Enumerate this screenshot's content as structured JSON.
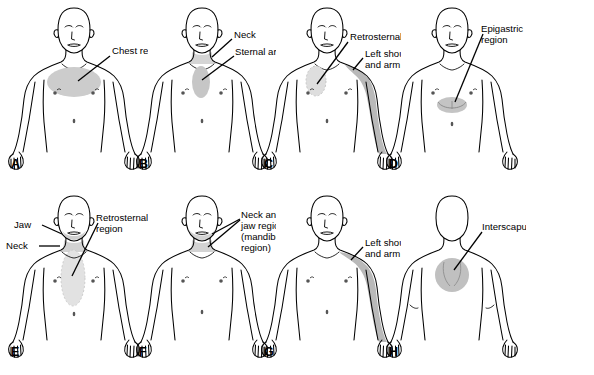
{
  "figure": {
    "body_outline_color": "#000000",
    "shade_color_light": "#d8d8d8",
    "shade_color_mid": "#c6c6c6",
    "shade_color_dark": "#b4b4b4",
    "background": "#ffffff",
    "caption_fragment": ""
  },
  "panels": [
    {
      "letter": "A",
      "view": "anterior",
      "labels": [
        {
          "text": "Chest region",
          "region": "chest"
        }
      ],
      "regions": [
        {
          "name": "chest-region",
          "shape": "ellipse",
          "shade": "#cccccc"
        }
      ]
    },
    {
      "letter": "B",
      "view": "anterior",
      "labels": [
        {
          "text": "Neck",
          "region": "neck"
        },
        {
          "text": "Sternal area",
          "region": "sternum"
        }
      ],
      "regions": [
        {
          "name": "neck-region",
          "shape": "band",
          "shade": "#d5d5d5"
        },
        {
          "name": "sternal-area",
          "shape": "vertical-oval",
          "shade": "#c6c6c6"
        }
      ]
    },
    {
      "letter": "C",
      "view": "anterior",
      "labels": [
        {
          "text": "Retrosternal region",
          "region": "retrosternal"
        },
        {
          "text": "Left shoulder",
          "region": "shoulder-arm"
        },
        {
          "text": "and arm",
          "region": "shoulder-arm"
        }
      ],
      "regions": [
        {
          "name": "retrosternal-region",
          "shape": "vertical-oval",
          "shade": "#dedede"
        },
        {
          "name": "left-shoulder-and-arm",
          "shape": "arm-band",
          "shade": "#b9b9b9"
        }
      ]
    },
    {
      "letter": "D",
      "view": "anterior",
      "labels": [
        {
          "text": "Epigastric",
          "region": "epigastric"
        },
        {
          "text": "region",
          "region": "epigastric"
        }
      ],
      "regions": [
        {
          "name": "epigastric-region",
          "shape": "lens",
          "shade": "#c4c4c4"
        }
      ]
    },
    {
      "letter": "E",
      "view": "anterior",
      "labels": [
        {
          "text": "Jaw",
          "region": "jaw"
        },
        {
          "text": "Neck",
          "region": "neck"
        },
        {
          "text": "Retrosternal",
          "region": "retrosternal"
        },
        {
          "text": "region",
          "region": "retrosternal"
        }
      ],
      "regions": [
        {
          "name": "jaw-region",
          "shape": "jaw-band",
          "shade": "#cfcfcf"
        },
        {
          "name": "neck-region",
          "shape": "band",
          "shade": "#d2d2d2"
        },
        {
          "name": "retrosternal-region",
          "shape": "long-oval",
          "shade": "#e2e2e2"
        }
      ]
    },
    {
      "letter": "F",
      "view": "anterior",
      "labels": [
        {
          "text": "Neck and",
          "region": "neck-jaw"
        },
        {
          "text": "jaw region",
          "region": "neck-jaw"
        },
        {
          "text": "(mandibular",
          "region": "neck-jaw"
        },
        {
          "text": "region)",
          "region": "neck-jaw"
        }
      ],
      "regions": [
        {
          "name": "neck-and-jaw-region",
          "shape": "jaw-neck-band",
          "shade": "#d3d3d3"
        }
      ]
    },
    {
      "letter": "G",
      "view": "anterior",
      "labels": [
        {
          "text": "Left shoulder",
          "region": "shoulder-arm"
        },
        {
          "text": "and arm",
          "region": "shoulder-arm"
        }
      ],
      "regions": [
        {
          "name": "left-shoulder-and-arm",
          "shape": "arm-band",
          "shade": "#b9b9b9"
        }
      ]
    },
    {
      "letter": "H",
      "view": "posterior",
      "labels": [
        {
          "text": "Interscapular",
          "region": "interscapular"
        }
      ],
      "regions": [
        {
          "name": "interscapular-region",
          "shape": "circle",
          "shade": "#c0c0c0"
        }
      ]
    }
  ]
}
